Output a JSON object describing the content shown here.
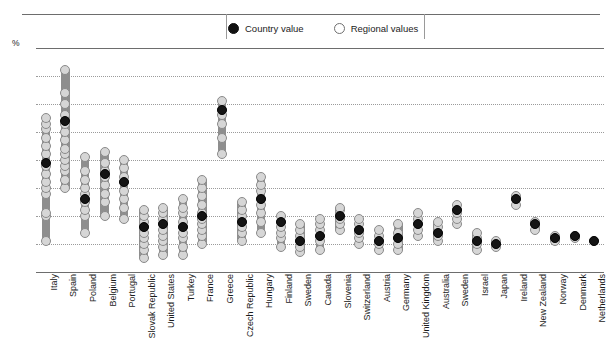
{
  "legend": {
    "country_label": "Country value",
    "regional_label": "Regional  values",
    "country_marker": "filled-circle",
    "regional_marker": "open-circle"
  },
  "axis": {
    "unit_label": "%",
    "y_ticks": [
      "80",
      "70",
      "60",
      "50",
      "40",
      "30",
      "20",
      "10",
      "0"
    ]
  },
  "colors": {
    "country_marker": "#141414",
    "regional_marker": "#d6d6d6",
    "range_bar": "#8e8e8e",
    "gridline": "#9b9b9b",
    "axis_line": "#6d6d6d"
  },
  "chart_data": {
    "type": "scatter",
    "title": "",
    "xlabel": "",
    "ylabel": "%",
    "ylim": [
      0,
      80
    ],
    "ytick_step": 10,
    "grid": true,
    "legend_position": "top-center",
    "categories": [
      "Italy",
      "Spain",
      "Poland",
      "Belgium",
      "Portugal",
      "Slovak Republic",
      "United States",
      "Turkey",
      "France",
      "Greece",
      "Czech Republic",
      "Hungary",
      "Finland",
      "Sweden",
      "Canada",
      "Slovenia",
      "Switzerland",
      "Austria",
      "Germany",
      "United Kingdom",
      "Australia",
      "Sweden",
      "Israel",
      "Japan",
      "Ireland",
      "New Zealand",
      "Norway",
      "Denmark",
      "Netherlands"
    ],
    "series": [
      {
        "name": "Country value",
        "marker": "filled-circle",
        "values": [
          39,
          54,
          26,
          35,
          32,
          16,
          17,
          16,
          20,
          58,
          18,
          26,
          18,
          11,
          13,
          20,
          15,
          11,
          12,
          17,
          14,
          22,
          11,
          10,
          26,
          17,
          12,
          13,
          11
        ]
      },
      {
        "name": "Regional values",
        "marker": "open-circle",
        "ranges": [
          {
            "category": "Italy",
            "min": 11,
            "max": 55
          },
          {
            "category": "Spain",
            "min": 30,
            "max": 72
          },
          {
            "category": "Poland",
            "min": 14,
            "max": 41
          },
          {
            "category": "Belgium",
            "min": 20,
            "max": 43
          },
          {
            "category": "Portugal",
            "min": 19,
            "max": 40
          },
          {
            "category": "Slovak Republic",
            "min": 5,
            "max": 22
          },
          {
            "category": "United States",
            "min": 6,
            "max": 23
          },
          {
            "category": "Turkey",
            "min": 6,
            "max": 26
          },
          {
            "category": "France",
            "min": 10,
            "max": 33
          },
          {
            "category": "Greece",
            "min": 42,
            "max": 61
          },
          {
            "category": "Czech Republic",
            "min": 11,
            "max": 25
          },
          {
            "category": "Hungary",
            "min": 14,
            "max": 34
          },
          {
            "category": "Finland",
            "min": 9,
            "max": 20
          },
          {
            "category": "Sweden",
            "min": 7,
            "max": 17
          },
          {
            "category": "Canada",
            "min": 8,
            "max": 19
          },
          {
            "category": "Slovenia",
            "min": 15,
            "max": 23
          },
          {
            "category": "Switzerland",
            "min": 10,
            "max": 19
          },
          {
            "category": "Austria",
            "min": 8,
            "max": 15
          },
          {
            "category": "Germany",
            "min": 8,
            "max": 17
          },
          {
            "category": "United Kingdom",
            "min": 13,
            "max": 21
          },
          {
            "category": "Australia",
            "min": 11,
            "max": 18
          },
          {
            "category": "Sweden",
            "min": 17,
            "max": 24
          },
          {
            "category": "Israel",
            "min": 8,
            "max": 14
          },
          {
            "category": "Japan",
            "min": 9,
            "max": 11
          },
          {
            "category": "Ireland",
            "min": 24,
            "max": 27
          },
          {
            "category": "New Zealand",
            "min": 15,
            "max": 18
          },
          {
            "category": "Norway",
            "min": 11,
            "max": 13
          },
          {
            "category": "Denmark",
            "min": 12,
            "max": 13
          },
          {
            "category": "Netherlands",
            "min": 11,
            "max": 11
          }
        ],
        "points": [
          {
            "category": "Italy",
            "values": [
              11,
              20,
              21,
              28,
              30,
              32,
              35,
              38,
              42,
              45,
              48,
              51,
              53,
              55
            ]
          },
          {
            "category": "Spain",
            "values": [
              30,
              33,
              36,
              38,
              40,
              42,
              44,
              47,
              50,
              53,
              56,
              60,
              64,
              72
            ]
          },
          {
            "category": "Poland",
            "values": [
              14,
              20,
              22,
              25,
              28,
              30,
              33,
              36,
              41
            ]
          },
          {
            "category": "Belgium",
            "values": [
              20,
              25,
              28,
              31,
              34,
              36,
              39,
              43
            ]
          },
          {
            "category": "Portugal",
            "values": [
              19,
              23,
              26,
              29,
              32,
              34,
              37,
              40
            ]
          },
          {
            "category": "Slovak Republic",
            "values": [
              5,
              8,
              10,
              12,
              14,
              16,
              18,
              20,
              22
            ]
          },
          {
            "category": "United States",
            "values": [
              6,
              9,
              11,
              13,
              15,
              17,
              19,
              21,
              23
            ]
          },
          {
            "category": "Turkey",
            "values": [
              6,
              9,
              12,
              14,
              16,
              18,
              21,
              23,
              26
            ]
          },
          {
            "category": "France",
            "values": [
              10,
              13,
              15,
              17,
              19,
              21,
              24,
              27,
              30,
              33
            ]
          },
          {
            "category": "Greece",
            "values": [
              42,
              48,
              53,
              56,
              58,
              61
            ]
          },
          {
            "category": "Czech Republic",
            "values": [
              11,
              14,
              16,
              18,
              20,
              22,
              25
            ]
          },
          {
            "category": "Hungary",
            "values": [
              14,
              18,
              21,
              24,
              26,
              29,
              31,
              34
            ]
          },
          {
            "category": "Finland",
            "values": [
              9,
              12,
              14,
              16,
              18,
              20
            ]
          },
          {
            "category": "Sweden",
            "values": [
              7,
              9,
              11,
              13,
              15,
              17
            ]
          },
          {
            "category": "Canada",
            "values": [
              8,
              11,
              13,
              15,
              17,
              19
            ]
          },
          {
            "category": "Slovenia",
            "values": [
              15,
              17,
              19,
              20,
              22,
              23
            ]
          },
          {
            "category": "Switzerland",
            "values": [
              10,
              12,
              14,
              15,
              17,
              19
            ]
          },
          {
            "category": "Austria",
            "values": [
              8,
              10,
              11,
              13,
              15
            ]
          },
          {
            "category": "Germany",
            "values": [
              8,
              10,
              12,
              14,
              17
            ]
          },
          {
            "category": "United Kingdom",
            "values": [
              13,
              15,
              17,
              19,
              21
            ]
          },
          {
            "category": "Australia",
            "values": [
              11,
              13,
              14,
              16,
              18
            ]
          },
          {
            "category": "Sweden",
            "values": [
              17,
              19,
              21,
              22,
              24
            ]
          },
          {
            "category": "Israel",
            "values": [
              8,
              10,
              11,
              12,
              14
            ]
          },
          {
            "category": "Japan",
            "values": [
              9,
              10,
              11
            ]
          },
          {
            "category": "Ireland",
            "values": [
              24,
              26,
              27
            ]
          },
          {
            "category": "New Zealand",
            "values": [
              15,
              17,
              18
            ]
          },
          {
            "category": "Norway",
            "values": [
              11,
              12,
              13
            ]
          },
          {
            "category": "Denmark",
            "values": [
              12,
              13
            ]
          },
          {
            "category": "Netherlands",
            "values": [
              11
            ]
          }
        ]
      }
    ]
  }
}
